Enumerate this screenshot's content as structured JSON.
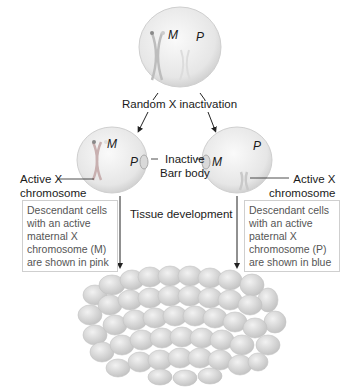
{
  "figure": {
    "top_cell": {
      "maternal_label": "M",
      "paternal_label": "P"
    },
    "process_label": "Random X inactivation",
    "left_cell": {
      "maternal_label": "M",
      "paternal_label": "P",
      "active_label_line1": "Active X",
      "active_label_line2": "chromosome"
    },
    "right_cell": {
      "maternal_label": "M",
      "paternal_label": "P",
      "active_label_line1": "Active X",
      "active_label_line2": "chromosome"
    },
    "barr_label_line1": "Inactive",
    "barr_label_line2": "Barr body",
    "development_label": "Tissue development",
    "left_note": [
      "Descendant cells",
      "with an active",
      "maternal X",
      "chromosome (M)",
      "are shown in pink"
    ],
    "right_note": [
      "Descendant cells",
      "with an active",
      "paternal X",
      "chromosome (P)",
      "are shown in blue"
    ],
    "colors": {
      "cell_fill": "#e9e9e9",
      "tissue_cell": "#d4d4d4",
      "line": "#222222",
      "box_border": "#cfcfcf"
    }
  }
}
